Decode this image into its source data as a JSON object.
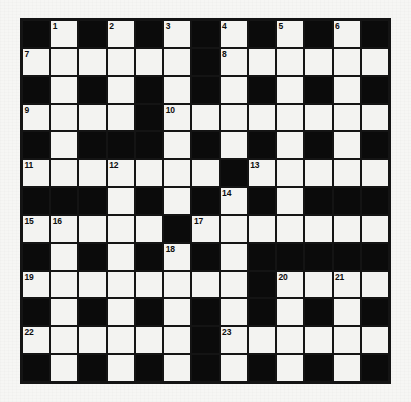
{
  "puzzle": {
    "title": "Crossword Grid",
    "type": "crossword",
    "rows": 13,
    "columns": 13,
    "colors": {
      "block": "#0b0b0b",
      "cell": "#f3f3f1",
      "border": "#141414",
      "number_text": "#0d0d0d",
      "page_background": "#f6f6f4"
    },
    "legend": {
      "white_symbol": ".",
      "black_symbol": "#"
    },
    "grid": [
      "#.#.#.#.#.#.#",
      "......#......",
      "#.#.#.#.#.#.#",
      "....#........",
      "#.###.#.#.#.#",
      ".......#.....",
      "###.#.#.#.###",
      ".....#.......",
      "#.#.#.#.#####",
      "........#....",
      "#.#.#.#.#.#.#",
      "......#......",
      "#.#.#.#.#.#.#"
    ],
    "numbers": [
      {
        "label": "1",
        "row": 0,
        "col": 1
      },
      {
        "label": "2",
        "row": 0,
        "col": 3
      },
      {
        "label": "3",
        "row": 0,
        "col": 5
      },
      {
        "label": "4",
        "row": 0,
        "col": 7
      },
      {
        "label": "5",
        "row": 0,
        "col": 9
      },
      {
        "label": "6",
        "row": 0,
        "col": 11
      },
      {
        "label": "7",
        "row": 1,
        "col": 0
      },
      {
        "label": "8",
        "row": 1,
        "col": 7
      },
      {
        "label": "9",
        "row": 3,
        "col": 0
      },
      {
        "label": "10",
        "row": 3,
        "col": 5
      },
      {
        "label": "11",
        "row": 5,
        "col": 0
      },
      {
        "label": "12",
        "row": 5,
        "col": 3
      },
      {
        "label": "13",
        "row": 5,
        "col": 8
      },
      {
        "label": "14",
        "row": 6,
        "col": 7
      },
      {
        "label": "15",
        "row": 7,
        "col": 0
      },
      {
        "label": "16",
        "row": 7,
        "col": 1
      },
      {
        "label": "17",
        "row": 7,
        "col": 6
      },
      {
        "label": "18",
        "row": 8,
        "col": 5
      },
      {
        "label": "19",
        "row": 9,
        "col": 0
      },
      {
        "label": "20",
        "row": 9,
        "col": 9
      },
      {
        "label": "21",
        "row": 9,
        "col": 11
      },
      {
        "label": "22",
        "row": 11,
        "col": 0
      },
      {
        "label": "23",
        "row": 11,
        "col": 7
      }
    ],
    "entry_count": 23
  }
}
